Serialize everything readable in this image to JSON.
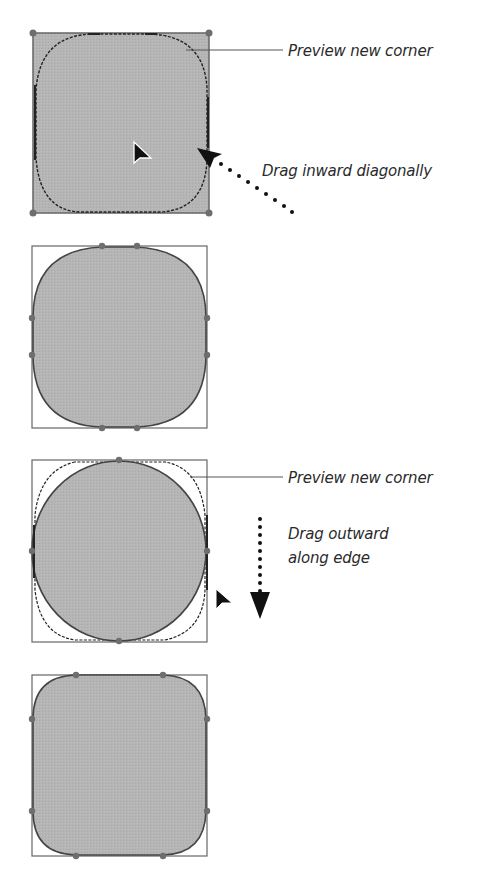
{
  "colors": {
    "fill": "#b3b3b3",
    "stroke": "#555555",
    "handle": "#6e6e6e",
    "preview": "#222222",
    "text": "#2a2a2a",
    "background": "#ffffff"
  },
  "panels": [
    {
      "step": 1,
      "description": "Square with all corners selected; preview of new rounded corner while dragging inward diagonally",
      "callouts": [
        {
          "text": "Preview new corner"
        },
        {
          "text": "Drag inward diagonally"
        }
      ]
    },
    {
      "step": 2,
      "description": "Result: square with large rounded corners"
    },
    {
      "step": 3,
      "description": "Circle-like shape with preview of new corner while dragging outward along edge",
      "callouts": [
        {
          "text": "Preview new corner"
        },
        {
          "text": "Drag outward",
          "line2": "along edge"
        }
      ]
    },
    {
      "step": 4,
      "description": "Result: square with smaller rounded corners"
    }
  ],
  "icons": {
    "cursor": "arrow-cursor-icon",
    "drag_arrow": "dotted-arrow-icon"
  }
}
